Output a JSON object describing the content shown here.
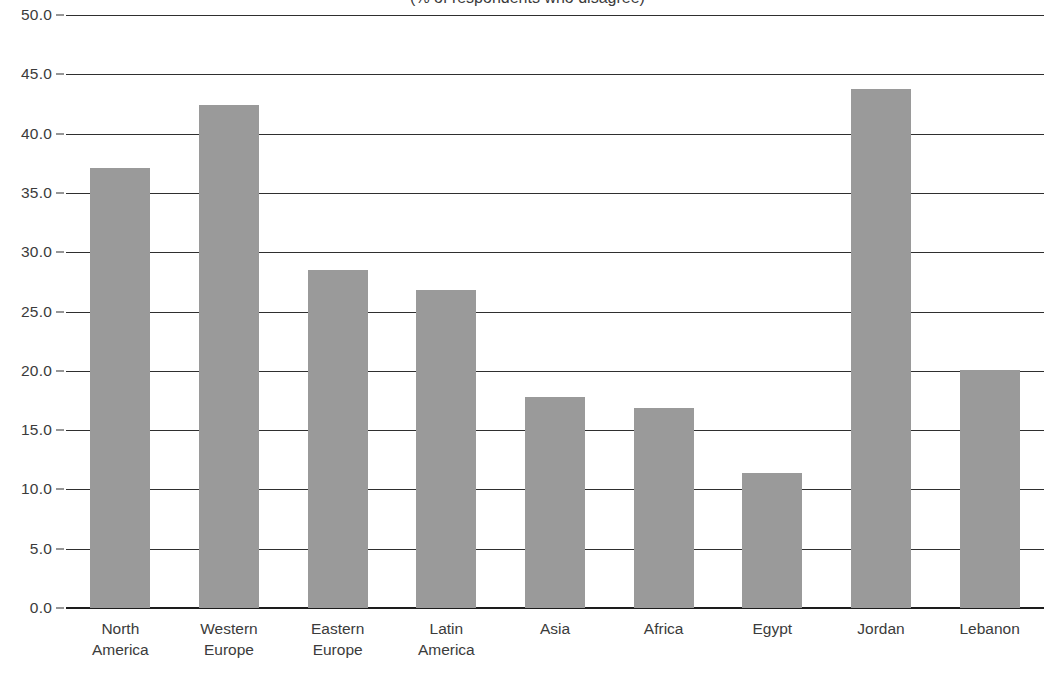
{
  "chart_data": {
    "type": "bar",
    "title": "(% of respondents who disagree)",
    "title_visibility": "clipped-at-top",
    "xlabel": "",
    "ylabel": "",
    "categories": [
      "North America",
      "Western Europe",
      "Eastern Europe",
      "Latin America",
      "Asia",
      "Africa",
      "Egypt",
      "Jordan",
      "Lebanon"
    ],
    "category_lines": [
      [
        "North",
        "America"
      ],
      [
        "Western",
        "Europe"
      ],
      [
        "Eastern",
        "Europe"
      ],
      [
        "Latin",
        "America"
      ],
      [
        "Asia"
      ],
      [
        "Africa"
      ],
      [
        "Egypt"
      ],
      [
        "Jordan"
      ],
      [
        "Lebanon"
      ]
    ],
    "values": [
      37.1,
      42.4,
      28.5,
      26.8,
      17.8,
      16.9,
      11.4,
      43.8,
      20.1
    ],
    "ylim": [
      0.0,
      50.0
    ],
    "ytick_step": 5.0,
    "ytick_labels": [
      "50.0",
      "45.0",
      "40.0",
      "35.0",
      "30.0",
      "25.0",
      "20.0",
      "15.0",
      "10.0",
      "5.0",
      "0.0"
    ],
    "ytick_values": [
      50.0,
      45.0,
      40.0,
      35.0,
      30.0,
      25.0,
      20.0,
      15.0,
      10.0,
      5.0,
      0.0
    ],
    "grid": true,
    "legend": "none",
    "bar_color": "#9a9a9a",
    "gridline_color": "#2f2f2f",
    "axis_color": "#1d1d1d",
    "text_color": "#3b3b3b",
    "background_color": "#ffffff"
  }
}
